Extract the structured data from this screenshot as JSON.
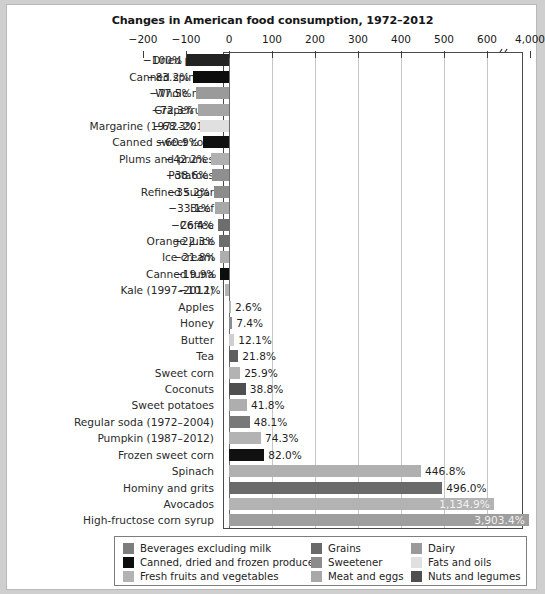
{
  "figure": {
    "title": "Changes in American food consumption, 1972–2012"
  },
  "axis": {
    "ticks": [
      {
        "label": "−200",
        "value": -200
      },
      {
        "label": "−100",
        "value": -100
      },
      {
        "label": "0",
        "value": 0
      },
      {
        "label": "100",
        "value": 100
      },
      {
        "label": "200",
        "value": 200
      },
      {
        "label": "300",
        "value": 300
      },
      {
        "label": "400",
        "value": 400
      },
      {
        "label": "500",
        "value": 500
      },
      {
        "label": "600",
        "value": 600
      },
      {
        "label": "4,000",
        "value": 4000
      }
    ],
    "has_break": true,
    "break_after": 600
  },
  "legend": {
    "columns": [
      [
        {
          "label": "Beverages excluding milk",
          "color": "#7d7d7d"
        },
        {
          "label": "Canned, dried and frozen produce",
          "color": "#0d0d0d"
        },
        {
          "label": "Fresh fruits and vegetables",
          "color": "#b3b3b3"
        }
      ],
      [
        {
          "label": "Grains",
          "color": "#6a6a6a"
        },
        {
          "label": "Sweetener",
          "color": "#8c8c8c"
        },
        {
          "label": "Meat and eggs",
          "color": "#a8a8a8"
        }
      ],
      [
        {
          "label": "Dairy",
          "color": "#9a9a9a"
        },
        {
          "label": "Fats and oils",
          "color": "#e0e0e0"
        },
        {
          "label": "Nuts and legumes",
          "color": "#4f4f4f"
        }
      ]
    ]
  },
  "chart_data": {
    "type": "bar",
    "orientation": "horizontal",
    "title": "Changes in American food consumption, 1972–2012",
    "xlabel": "",
    "ylabel": "",
    "xlim": [
      -200,
      700
    ],
    "grid": true,
    "legend_position": "bottom",
    "value_unit": "percent",
    "categories": [
      "Dried pears",
      "Canned spinach",
      "Whole milk",
      "Grapefruits",
      "Margarine (1972–2010)",
      "Canned sweet corn",
      "Plums and prunes",
      "Potatoes",
      "Refined sugar",
      "Beef",
      "Coffee",
      "Orange juice",
      "Ice cream",
      "Canned tuna",
      "Kale (1997–2012)",
      "Apples",
      "Honey",
      "Butter",
      "Tea",
      "Sweet corn",
      "Coconuts",
      "Sweet potatoes",
      "Regular soda (1972–2004)",
      "Pumpkin (1987–2012)",
      "Frozen sweet corn",
      "Spinach",
      "Hominy and grits",
      "Avocados",
      "High-fructose corn syrup"
    ],
    "values": [
      -100,
      -83.2,
      -77.5,
      -72.3,
      -68.3,
      -60.9,
      -42.2,
      -38.6,
      -35.2,
      -33.1,
      -26.4,
      -22.3,
      -21.8,
      -19.9,
      -10.1,
      2.6,
      7.4,
      12.1,
      21.8,
      25.9,
      38.8,
      41.8,
      48.1,
      74.3,
      82.0,
      446.8,
      496.0,
      1134.9,
      3903.4
    ],
    "value_labels": [
      "−100%",
      "−83.2%",
      "−77.5%",
      "−72.3%",
      "−68.3%",
      "−60.9%",
      "−42.2%",
      "−38.6%",
      "−35.2%",
      "−33.1%",
      "−26.4%",
      "−22.3%",
      "−21.8%",
      "−19.9%",
      "−10.1%",
      "2.6%",
      "7.4%",
      "12.1%",
      "21.8%",
      "25.9%",
      "38.8%",
      "41.8%",
      "48.1%",
      "74.3%",
      "82.0%",
      "446.8%",
      "496.0%",
      "1,134.9%",
      "3,903.4%"
    ],
    "series_groups": [
      "Canned, dried and frozen produce",
      "Canned, dried and frozen produce",
      "Dairy",
      "Fresh fruits and vegetables",
      "Fats and oils",
      "Canned, dried and frozen produce",
      "Fresh fruits and vegetables",
      "Fresh fruits and vegetables",
      "Sweetener",
      "Meat and eggs",
      "Beverages excluding milk",
      "Beverages excluding milk",
      "Dairy",
      "Canned, dried and frozen produce",
      "Fresh fruits and vegetables",
      "Fresh fruits and vegetables",
      "Sweetener",
      "Fats and oils",
      "Beverages excluding milk",
      "Fresh fruits and vegetables",
      "Nuts and legumes",
      "Fresh fruits and vegetables",
      "Beverages excluding milk",
      "Fresh fruits and vegetables",
      "Canned, dried and frozen produce",
      "Fresh fruits and vegetables",
      "Grains",
      "Fresh fruits and vegetables",
      "Sweetener"
    ],
    "bar_colors": [
      "#232323",
      "#0d0d0d",
      "#9a9a9a",
      "#a5a5a5",
      "#e0e0e0",
      "#111111",
      "#b0b0b0",
      "#8f8f8f",
      "#8c8c8c",
      "#a8a8a8",
      "#6d6d6d",
      "#6d6d6d",
      "#aeaeae",
      "#0d0d0d",
      "#b3b3b3",
      "#b3b3b3",
      "#8c8c8c",
      "#cfcfcf",
      "#5e5e5e",
      "#b3b3b3",
      "#4f4f4f",
      "#aeaeae",
      "#787878",
      "#b3b3b3",
      "#111111",
      "#b0b0b0",
      "#6a6a6a",
      "#b3b3b3",
      "#9e9e9e"
    ]
  }
}
